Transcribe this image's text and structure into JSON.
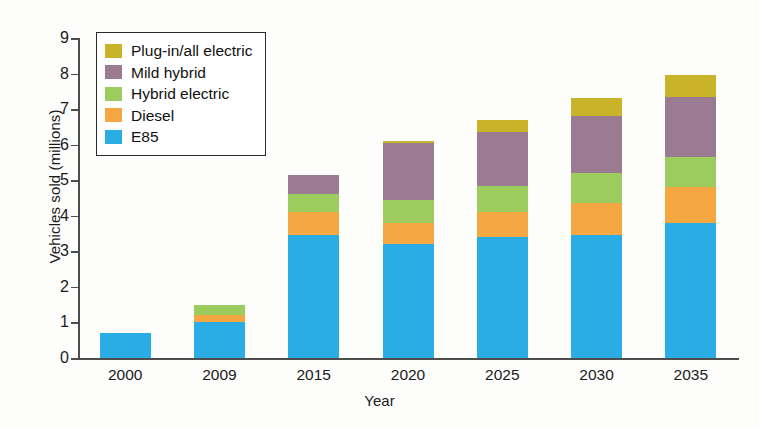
{
  "chart_data": {
    "type": "bar",
    "stacked": true,
    "title": "",
    "xlabel": "Year",
    "ylabel": "Vehicles sold (millions)",
    "categories": [
      "2000",
      "2009",
      "2015",
      "2020",
      "2025",
      "2030",
      "2035"
    ],
    "ylim": [
      0,
      9
    ],
    "yticks": [
      0,
      1,
      2,
      3,
      4,
      5,
      6,
      7,
      8,
      9
    ],
    "grid": false,
    "legend_position": "top-left inside plot",
    "series": [
      {
        "name": "E85",
        "color": "#29ade4",
        "values": [
          0.7,
          1.0,
          3.45,
          3.2,
          3.4,
          3.45,
          3.8
        ]
      },
      {
        "name": "Diesel",
        "color": "#f5a742",
        "values": [
          0.0,
          0.2,
          0.65,
          0.6,
          0.7,
          0.9,
          1.0
        ]
      },
      {
        "name": "Hybrid electric",
        "color": "#9ccb5e",
        "values": [
          0.0,
          0.3,
          0.5,
          0.65,
          0.75,
          0.85,
          0.85
        ]
      },
      {
        "name": "Mild hybrid",
        "color": "#9b7b92",
        "values": [
          0.0,
          0.0,
          0.55,
          1.6,
          1.5,
          1.6,
          1.7
        ]
      },
      {
        "name": "Plug-in/all electric",
        "color": "#c9b429",
        "values": [
          0.0,
          0.0,
          0.0,
          0.05,
          0.35,
          0.5,
          0.6
        ]
      }
    ],
    "totals": [
      0.7,
      1.5,
      5.15,
      6.1,
      6.7,
      7.3,
      7.95
    ]
  },
  "legend": {
    "items": [
      {
        "label": "Plug-in/all electric",
        "color": "#c9b429"
      },
      {
        "label": "Mild hybrid",
        "color": "#9b7b92"
      },
      {
        "label": "Hybrid electric",
        "color": "#9ccb5e"
      },
      {
        "label": "Diesel",
        "color": "#f5a742"
      },
      {
        "label": "E85",
        "color": "#29ade4"
      }
    ]
  }
}
